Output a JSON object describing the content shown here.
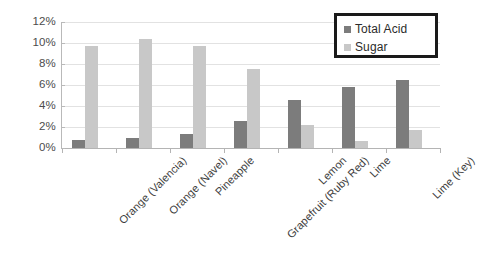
{
  "chart_data": {
    "type": "bar",
    "title": "",
    "xlabel": "",
    "ylabel": "",
    "ylim": [
      0,
      12
    ],
    "ytick_labels": [
      "12%",
      "10%",
      "8%",
      "6%",
      "4%",
      "2%",
      "0%"
    ],
    "ytick_values": [
      12,
      10,
      8,
      6,
      4,
      2,
      0
    ],
    "grid": true,
    "legend_position": "top-right",
    "categories": [
      "Orange (Valencia)",
      "Orange (Navel)",
      "Pineapple",
      "Grapefruit (Ruby Red)",
      "Lemon",
      "Lime",
      "Lime (Key)"
    ],
    "series": [
      {
        "name": "Total Acid",
        "color": "#7c7c7c",
        "values": [
          0.8,
          1.0,
          1.3,
          2.6,
          4.6,
          5.8,
          6.45
        ]
      },
      {
        "name": "Sugar",
        "color": "#c8c8c8",
        "values": [
          9.7,
          10.4,
          9.7,
          7.55,
          2.15,
          0.7,
          1.75
        ]
      }
    ]
  },
  "legend": {
    "items": [
      {
        "label": "Total Acid",
        "swatch": "acid"
      },
      {
        "label": "Sugar",
        "swatch": "sugar"
      }
    ]
  },
  "colors": {
    "acid": "#7c7c7c",
    "sugar": "#c8c8c8",
    "gridline": "#e2e2e2",
    "axis": "#b4b4b4",
    "legend_border": "#1a1a1a",
    "background": "#ffffff"
  }
}
